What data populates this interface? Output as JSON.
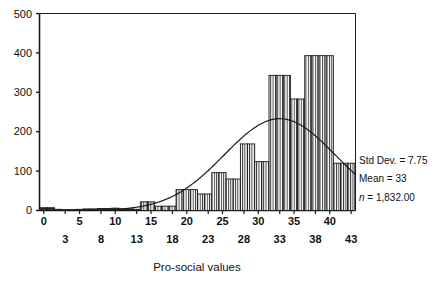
{
  "chart_data": {
    "type": "bar",
    "title": "",
    "subtitle": "",
    "xlabel": "Pro-social values",
    "ylabel": "",
    "xlim": [
      -0.6,
      43.6
    ],
    "ylim": [
      0,
      500
    ],
    "grid": false,
    "legend": null,
    "bin_width": 1,
    "categories": [
      0,
      1,
      2,
      3,
      4,
      5,
      6,
      7,
      8,
      9,
      10,
      11,
      12,
      13,
      14,
      15,
      16,
      17,
      18,
      19,
      20,
      21,
      22,
      23,
      24,
      25,
      26,
      27,
      28,
      29,
      30,
      31,
      32,
      33,
      34,
      35,
      36,
      37,
      38,
      39,
      40,
      41,
      42,
      43
    ],
    "values": [
      7,
      7,
      3,
      2,
      2,
      3,
      4,
      4,
      5,
      5,
      6,
      4,
      4,
      3,
      22,
      22,
      11,
      11,
      11,
      53,
      53,
      53,
      42,
      42,
      96,
      96,
      80,
      80,
      169,
      169,
      124,
      124,
      343,
      343,
      343,
      283,
      283,
      393,
      393,
      393,
      393,
      120,
      120,
      120
    ],
    "x_tick_labels_top": [
      "0",
      "5",
      "10",
      "15",
      "20",
      "25",
      "30",
      "35",
      "40"
    ],
    "x_tick_values_top": [
      0,
      5,
      10,
      15,
      20,
      25,
      30,
      35,
      40
    ],
    "x_tick_labels_bottom": [
      "3",
      "8",
      "13",
      "18",
      "23",
      "28",
      "33",
      "38",
      "43"
    ],
    "x_tick_values_bottom": [
      3,
      8,
      13,
      18,
      23,
      28,
      33,
      38,
      43
    ],
    "y_tick_labels": [
      "0",
      "100",
      "200",
      "300",
      "400",
      "500"
    ],
    "y_tick_values": [
      0,
      100,
      200,
      300,
      400,
      500
    ],
    "overlay_curve": {
      "type": "normal",
      "mean": 33,
      "std_dev": 7.75,
      "n": 1832,
      "peak_value": 233,
      "description": "normal distribution curve"
    },
    "annotations": {
      "std_dev_label": "Std Dev. = 7.75",
      "mean_label": "Mean = 33",
      "n_symbol": "n",
      "n_value": " = 1,832.00"
    },
    "colors": {
      "bar_fill": "#ffffff",
      "bar_hatch": "#2b2b2b",
      "bar_stroke": "#1a1a1a",
      "curve": "#1a1a1a",
      "axis": "#1a1a1a",
      "text": "#111111",
      "background": "#ffffff"
    }
  },
  "figure": {
    "axis_title": "Pro-social values"
  }
}
